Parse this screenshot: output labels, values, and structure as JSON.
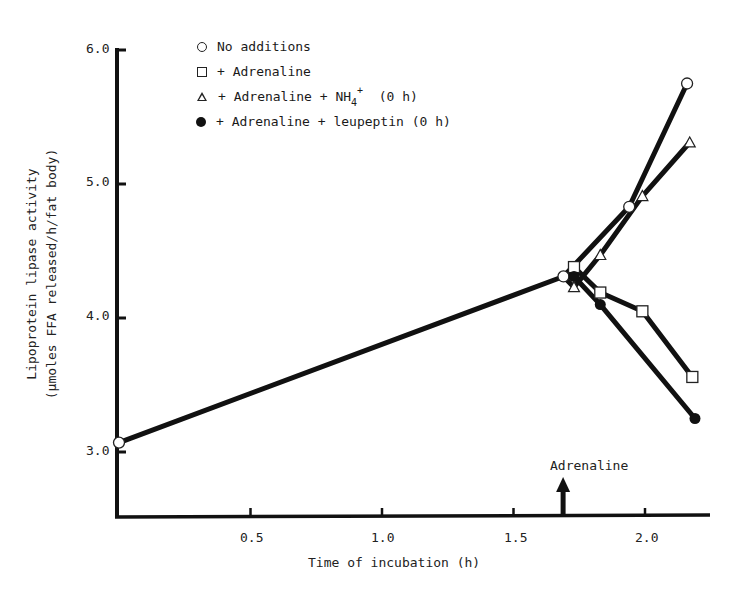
{
  "chart_data": {
    "type": "line",
    "title": "",
    "xlabel": "Time of incubation (h)",
    "ylabel_line1": "Lipoprotein lipase activity",
    "ylabel_line2": "(μmoles FFA released/h/fat body)",
    "xlim": [
      0,
      2.25
    ],
    "ylim": [
      2.5,
      6.0
    ],
    "x_ticks": [
      "0.5",
      "1.0",
      "1.5",
      "2.0"
    ],
    "y_ticks": [
      "3.0",
      "4.0",
      "5.0",
      "6.0"
    ],
    "grid": false,
    "legend_position": "top-left inside",
    "series": [
      {
        "name": "No additions",
        "marker": "open-circle",
        "x": [
          0.0,
          1.69,
          1.94,
          2.16
        ],
        "y": [
          3.07,
          4.31,
          4.83,
          5.75
        ]
      },
      {
        "name": "+ Adrenaline",
        "marker": "open-square",
        "x": [
          1.69,
          1.73,
          1.83,
          1.99,
          2.18
        ],
        "y": [
          4.31,
          4.38,
          4.19,
          4.05,
          3.56
        ]
      },
      {
        "name": "+ Adrenaline + NH4+ (0 h)",
        "marker": "open-triangle",
        "x": [
          1.69,
          1.73,
          1.83,
          1.99,
          2.17
        ],
        "y": [
          4.31,
          4.23,
          4.47,
          4.91,
          5.31
        ]
      },
      {
        "name": "+ Adrenaline + leupeptin (0 h)",
        "marker": "filled-circle",
        "x": [
          1.69,
          1.73,
          1.83,
          2.19
        ],
        "y": [
          4.31,
          4.31,
          4.1,
          3.25
        ]
      }
    ],
    "annotations": [
      {
        "text": "Adrenaline",
        "type": "arrow-up",
        "x": 1.7
      }
    ]
  },
  "legend": {
    "items": [
      {
        "label": "No additions"
      },
      {
        "label": "+ Adrenaline"
      },
      {
        "label_pre": "+ Adrenaline + NH",
        "label_sub": "4",
        "label_sup": "+",
        "label_post": "  (0 h)"
      },
      {
        "label": "+ Adrenaline + leupeptin (0 h)"
      }
    ]
  },
  "axes": {
    "x_title": "Time of incubation (h)",
    "y_title_line1": "Lipoprotein lipase activity",
    "y_title_line2": "(μmoles FFA released/h/fat body)",
    "x_ticks": [
      "0.5",
      "1.0",
      "1.5",
      "2.0"
    ],
    "y_ticks": [
      "3.0",
      "4.0",
      "5.0",
      "6.0"
    ]
  },
  "annotation": {
    "label": "Adrenaline"
  }
}
